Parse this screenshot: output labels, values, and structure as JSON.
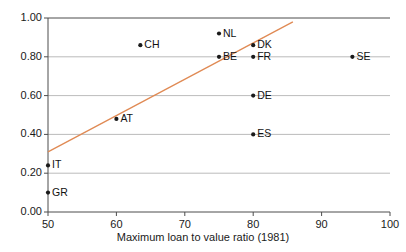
{
  "chart_data": {
    "type": "scatter",
    "title": "",
    "xlabel": "Maximum loan to value ratio (1981)",
    "ylabel": "",
    "xlim": [
      50,
      100
    ],
    "ylim": [
      0.0,
      1.0
    ],
    "xticks": [
      "50",
      "60",
      "70",
      "80",
      "90",
      "100"
    ],
    "yticks": [
      "0.00",
      "0.20",
      "0.40",
      "0.60",
      "0.80",
      "1.00"
    ],
    "grid": "horizontal",
    "legend": "none",
    "point_color": "#1a1a1a",
    "trendline_color": "#e08a54",
    "axis_color": "#4d4d4d",
    "grid_color": "#a9a9a9",
    "points": [
      {
        "label": "GR",
        "x": 50.0,
        "y": 0.1
      },
      {
        "label": "IT",
        "x": 50.0,
        "y": 0.24
      },
      {
        "label": "AT",
        "x": 60.0,
        "y": 0.48
      },
      {
        "label": "CH",
        "x": 63.5,
        "y": 0.86
      },
      {
        "label": "NL",
        "x": 75.0,
        "y": 0.92
      },
      {
        "label": "BE",
        "x": 75.0,
        "y": 0.8
      },
      {
        "label": "DK",
        "x": 80.0,
        "y": 0.86
      },
      {
        "label": "FR",
        "x": 80.0,
        "y": 0.8
      },
      {
        "label": "DE",
        "x": 80.0,
        "y": 0.6
      },
      {
        "label": "ES",
        "x": 80.0,
        "y": 0.4
      },
      {
        "label": "SE",
        "x": 94.5,
        "y": 0.8
      }
    ],
    "trendline": {
      "x0": 50.0,
      "y0": 0.31,
      "x1": 85.8,
      "y1": 0.98
    }
  }
}
